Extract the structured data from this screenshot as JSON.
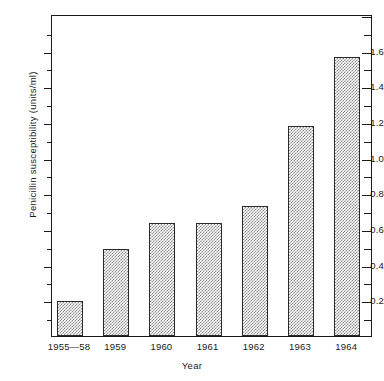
{
  "chart_data": {
    "type": "bar",
    "title": "",
    "xlabel": "Year",
    "ylabel": "Penicillin susceptibility (units/ml)",
    "categories": [
      "1955—58",
      "1959",
      "1960",
      "1961",
      "1962",
      "1963",
      "1964"
    ],
    "values": [
      0.195,
      0.49,
      0.635,
      0.635,
      0.73,
      1.18,
      1.565
    ],
    "ylim": [
      0,
      1.805
    ],
    "ytick_labels": [
      "0.2",
      "0.4",
      "0.6",
      "0.8",
      "1.0",
      "1.2",
      "1.4",
      "1.6"
    ],
    "ytick_values": [
      0.2,
      0.4,
      0.6,
      0.8,
      1.0,
      1.2,
      1.4,
      1.6
    ],
    "yminor_values": [
      0.1,
      0.3,
      0.5,
      0.7,
      0.9,
      1.1,
      1.3,
      1.5,
      1.7
    ],
    "grid": false,
    "legend": null,
    "bar_fill": "#8c8c8c",
    "bar_edge": "#2a2a2a",
    "axis_color": "#1a1a1a",
    "background": "#ffffff"
  }
}
